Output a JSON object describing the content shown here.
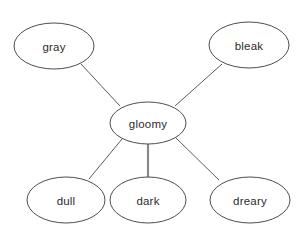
{
  "diagram": {
    "type": "word-web",
    "background_color": "#ffffff",
    "node_fill_color": "#ffffff",
    "node_border_color": "#4d4d4d",
    "edge_color": "#5a5a5a",
    "highlight_edge_color": "#8a8a8a",
    "text_color": "#2b2b2b",
    "center": {
      "id": "gloomy",
      "label": "gloomy",
      "cx": 148,
      "cy": 123,
      "rx": 38,
      "ry": 21
    },
    "nodes": [
      {
        "id": "gray",
        "label": "gray",
        "cx": 54,
        "cy": 46,
        "rx": 40,
        "ry": 23,
        "position": "top-left"
      },
      {
        "id": "bleak",
        "label": "bleak",
        "cx": 249,
        "cy": 45,
        "rx": 40,
        "ry": 23,
        "position": "top-right"
      },
      {
        "id": "dull",
        "label": "dull",
        "cx": 66,
        "cy": 200,
        "rx": 39,
        "ry": 23,
        "position": "bottom-left"
      },
      {
        "id": "dark",
        "label": "dark",
        "cx": 148,
        "cy": 200,
        "rx": 38,
        "ry": 23,
        "position": "bottom-center"
      },
      {
        "id": "dreary",
        "label": "dreary",
        "cx": 250,
        "cy": 200,
        "rx": 40,
        "ry": 23,
        "position": "bottom-right"
      }
    ],
    "edges": [
      {
        "id": "gloomy-gray",
        "from": "gloomy",
        "to": "gray",
        "x1": 120,
        "y1": 106,
        "x2": 81,
        "y2": 64,
        "emphasis": "normal"
      },
      {
        "id": "gloomy-bleak",
        "from": "gloomy",
        "to": "bleak",
        "x1": 175,
        "y1": 106,
        "x2": 222,
        "y2": 64,
        "emphasis": "normal"
      },
      {
        "id": "gloomy-dull",
        "from": "gloomy",
        "to": "dull",
        "x1": 122,
        "y1": 139,
        "x2": 89,
        "y2": 179,
        "emphasis": "normal"
      },
      {
        "id": "gloomy-dark",
        "from": "gloomy",
        "to": "dark",
        "x1": 148,
        "y1": 144,
        "x2": 148,
        "y2": 178,
        "emphasis": "thick"
      },
      {
        "id": "gloomy-dreary",
        "from": "gloomy",
        "to": "dreary",
        "x1": 176,
        "y1": 138,
        "x2": 219,
        "y2": 180,
        "emphasis": "normal"
      }
    ]
  }
}
